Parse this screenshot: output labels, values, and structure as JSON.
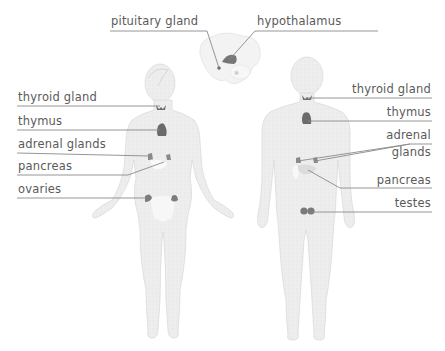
{
  "diagram": {
    "title": "",
    "figures": [
      {
        "name": "female",
        "description": "female human body silhouette with endocrine glands"
      },
      {
        "name": "brain",
        "description": "brain cross-section showing pituitary gland and hypothalamus"
      },
      {
        "name": "male",
        "description": "male human body silhouette with endocrine glands"
      }
    ],
    "labels": {
      "pituitary": "pituitary gland",
      "hypothalamus": "hypothalamus",
      "female_thyroid": "thyroid gland",
      "female_thymus": "thymus",
      "female_adrenal": "adrenal glands",
      "female_pancreas": "pancreas",
      "female_ovaries": "ovaries",
      "male_thyroid": "thyroid gland",
      "male_thymus": "thymus",
      "male_adrenal_1": "adrenal",
      "male_adrenal_2": "glands",
      "male_pancreas": "pancreas",
      "male_testes": "testes"
    },
    "colors": {
      "body_fill": "#ececec",
      "body_stroke": "#d6d6d6",
      "gland_fill": "#7a7a7a",
      "pancreas_fill": "#f6f6f6",
      "leader_line": "#8a8a8a",
      "label_text": "#5a5a5a"
    }
  }
}
